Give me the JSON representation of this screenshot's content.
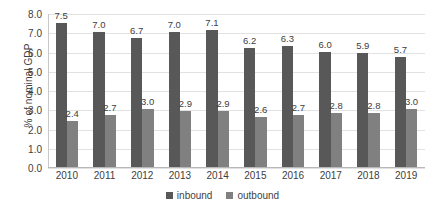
{
  "chart_data": {
    "type": "bar",
    "title": "",
    "xlabel": "",
    "ylabel": "% of nominal GDP",
    "categories": [
      "2010",
      "2011",
      "2012",
      "2013",
      "2014",
      "2015",
      "2016",
      "2017",
      "2018",
      "2019"
    ],
    "series": [
      {
        "name": "inbound",
        "color": "#585858",
        "values": [
          7.5,
          7.0,
          6.7,
          7.0,
          7.1,
          6.2,
          6.3,
          6.0,
          5.9,
          5.7
        ],
        "labels": [
          "7.5",
          "7.0",
          "6.7",
          "7.0",
          "7.1",
          "6.2",
          "6.3",
          "6.0",
          "5.9",
          "5.7"
        ]
      },
      {
        "name": "outbound",
        "color": "#808080",
        "values": [
          2.4,
          2.7,
          3.0,
          2.9,
          2.9,
          2.6,
          2.7,
          2.8,
          2.8,
          3.0
        ],
        "labels": [
          "2.4",
          "2.7",
          "3.0",
          "2.9",
          "2.9",
          "2.6",
          "2.7",
          "2.8",
          "2.8",
          "3.0"
        ]
      }
    ],
    "ylim": [
      0.0,
      8.0
    ],
    "y_ticks": [
      "0.0",
      "1.0",
      "2.0",
      "3.0",
      "4.0",
      "5.0",
      "6.0",
      "7.0",
      "8.0"
    ],
    "y_tick_values": [
      0.0,
      1.0,
      2.0,
      3.0,
      4.0,
      5.0,
      6.0,
      7.0,
      8.0
    ],
    "grid": true,
    "legend_position": "bottom",
    "legend": [
      "inbound",
      "outbound"
    ]
  }
}
